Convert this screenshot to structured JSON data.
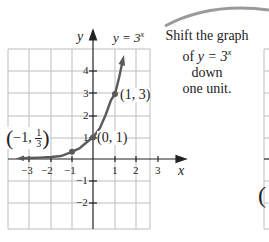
{
  "left_graph": {
    "function_label": "y = 3",
    "function_exponent": "x",
    "x_axis_label": "x",
    "y_axis_label": "y",
    "x_ticks": [
      "−3",
      "−2",
      "−1",
      "1",
      "2",
      "3"
    ],
    "y_ticks": [
      "4",
      "3",
      "2",
      "1",
      "−1",
      "−2"
    ],
    "points": [
      {
        "label": "(1, 3)"
      },
      {
        "label": "(0, 1)"
      },
      {
        "label_prefix": "(−1, ",
        "frac_num": "1",
        "frac_den": "3",
        "label_suffix": ")"
      }
    ],
    "curve_color": "#555555"
  },
  "annotation": {
    "line1": "Shift the graph",
    "line2_prefix": "of ",
    "line2_eq": "y = 3",
    "line2_exp": "x",
    "line3": "down",
    "line4": "one unit."
  },
  "right_graph": {
    "partial_label": "("
  }
}
